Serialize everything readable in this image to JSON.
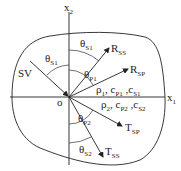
{
  "diagram": {
    "axes": {
      "x1": {
        "base": "x",
        "sub": "1"
      },
      "x2": {
        "base": "x",
        "sub": "2"
      },
      "origin": "o"
    },
    "incident_wave": "SV",
    "angles": {
      "theta_s1_incident": {
        "base": "θ",
        "sub": "S1"
      },
      "theta_s1_reflected": {
        "base": "θ",
        "sub": "S1"
      },
      "theta_p1": {
        "base": "θ",
        "sub": "P1"
      },
      "theta_p2": {
        "base": "θ",
        "sub": "P2"
      },
      "theta_s2": {
        "base": "θ",
        "sub": "S2"
      }
    },
    "rays": {
      "R_SS": {
        "base": "R",
        "sub": "SS"
      },
      "R_SP": {
        "base": "R",
        "sub": "SP"
      },
      "T_SP": {
        "base": "T",
        "sub": "SP"
      },
      "T_SS": {
        "base": "T",
        "sub": "SS"
      }
    },
    "media": {
      "upper": {
        "rho": "ρ",
        "rho_sub": "1",
        "cp": "c",
        "cp_sub": "P1",
        "cs": "c",
        "cs_sub": "S1"
      },
      "lower": {
        "rho": "ρ",
        "rho_sub": "2",
        "cp": "c",
        "cp_sub": "P2",
        "cs": "c",
        "cs_sub": "S2"
      }
    }
  }
}
